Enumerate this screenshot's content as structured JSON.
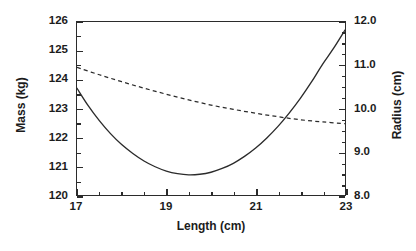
{
  "figure": {
    "width": 416,
    "height": 251,
    "background": "#ffffff",
    "foreground": "#1c1c1c"
  },
  "chart_data": {
    "type": "line",
    "title": "",
    "xlabel": "Length (cm)",
    "ylabel": "Mass (kg)",
    "y2label": "Radius (cm)",
    "xlim": [
      17,
      23
    ],
    "ylim": [
      120,
      126
    ],
    "y2lim": [
      8.0,
      12.0
    ],
    "grid": false,
    "legend": "none",
    "xticks": [
      17,
      19,
      21,
      23
    ],
    "xticklabels": [
      "17",
      "19",
      "21",
      "23"
    ],
    "xminorticks": [
      17.5,
      18,
      18.5,
      19.5,
      20,
      20.5,
      21.5,
      22,
      22.5
    ],
    "yticks": [
      120,
      121,
      122,
      123,
      124,
      125,
      126
    ],
    "yticklabels": [
      "120",
      "121",
      "122",
      "123",
      "124",
      "125",
      "126"
    ],
    "yminorticks": [
      120.5,
      121.5,
      122.5,
      123.5,
      124.5,
      125.5
    ],
    "y2ticks": [
      8.0,
      9.0,
      10.0,
      11.0,
      12.0
    ],
    "y2ticklabels": [
      "8.0",
      "9.0",
      "10.0",
      "11.0",
      "12.0"
    ],
    "y2minorticks": [
      8.25,
      8.5,
      8.75,
      9.25,
      9.5,
      9.75,
      10.25,
      10.5,
      10.75,
      11.25,
      11.5,
      11.75
    ],
    "series": [
      {
        "name": "Mass",
        "axis": "left",
        "style": "solid",
        "color": "#2b2b2b",
        "x": [
          17.0,
          17.25,
          17.5,
          17.75,
          18.0,
          18.25,
          18.5,
          18.75,
          19.0,
          19.25,
          19.5,
          19.75,
          20.0,
          20.25,
          20.5,
          20.75,
          21.0,
          21.25,
          21.5,
          21.75,
          22.0,
          22.25,
          22.5,
          22.75,
          23.0
        ],
        "values": [
          123.7,
          123.1,
          122.58,
          122.13,
          121.75,
          121.44,
          121.18,
          120.98,
          120.83,
          120.74,
          120.7,
          120.72,
          120.79,
          120.92,
          121.1,
          121.34,
          121.63,
          121.98,
          122.38,
          122.84,
          123.35,
          123.92,
          124.54,
          125.1,
          125.72
        ]
      },
      {
        "name": "Radius",
        "axis": "right",
        "style": "dashed",
        "color": "#2b2b2b",
        "x": [
          17.0,
          17.5,
          18.0,
          18.5,
          19.0,
          19.5,
          20.0,
          20.5,
          21.0,
          21.5,
          22.0,
          22.5,
          23.0
        ],
        "values": [
          10.95,
          10.78,
          10.62,
          10.47,
          10.33,
          10.2,
          10.08,
          9.98,
          9.89,
          9.81,
          9.74,
          9.69,
          9.65
        ]
      }
    ],
    "annotations": {
      "crossing_point": {
        "x": 21.4,
        "mass": 122.8,
        "radius": 9.79
      }
    }
  }
}
